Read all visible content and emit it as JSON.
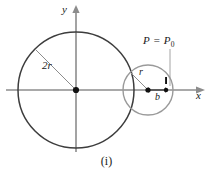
{
  "figure": {
    "caption": "(i)",
    "axes": {
      "x_label": "x",
      "y_label": "y",
      "origin_x": 76,
      "origin_y": 90
    },
    "labels": {
      "big_radius": "2r",
      "small_radius": "r",
      "offset": "b",
      "point_main": "P",
      "point_equals": " = ",
      "point_sub_base": "P",
      "point_sub_index": "0"
    },
    "colors": {
      "big_circle_stroke": "#3d3d3d",
      "small_circle_stroke": "#9a9a9a",
      "axis_stroke": "#8c8c8c",
      "radius_line_stroke": "#8c8c8c",
      "dot_fill": "#111111",
      "text": "#1a1a1a",
      "background": "#ffffff"
    },
    "geometry": {
      "big_circle": {
        "cx": 76,
        "cy": 90,
        "r": 58
      },
      "small_circle": {
        "cx": 148,
        "cy": 90,
        "r": 25
      },
      "origin_dot": {
        "cx": 76,
        "cy": 90,
        "r": 3.1
      },
      "small_center_dot": {
        "cx": 148,
        "cy": 90,
        "r": 2.6
      },
      "p0_dot": {
        "cx": 166,
        "cy": 90,
        "r": 2.2
      },
      "p0_tick_top": {
        "x": 166,
        "y": 78
      },
      "b_arrow": {
        "x1": 148,
        "x2": 166,
        "y": 90
      },
      "leader_line": {
        "x1": 170,
        "y1": 48,
        "x2": 170,
        "y2": 85
      }
    }
  }
}
